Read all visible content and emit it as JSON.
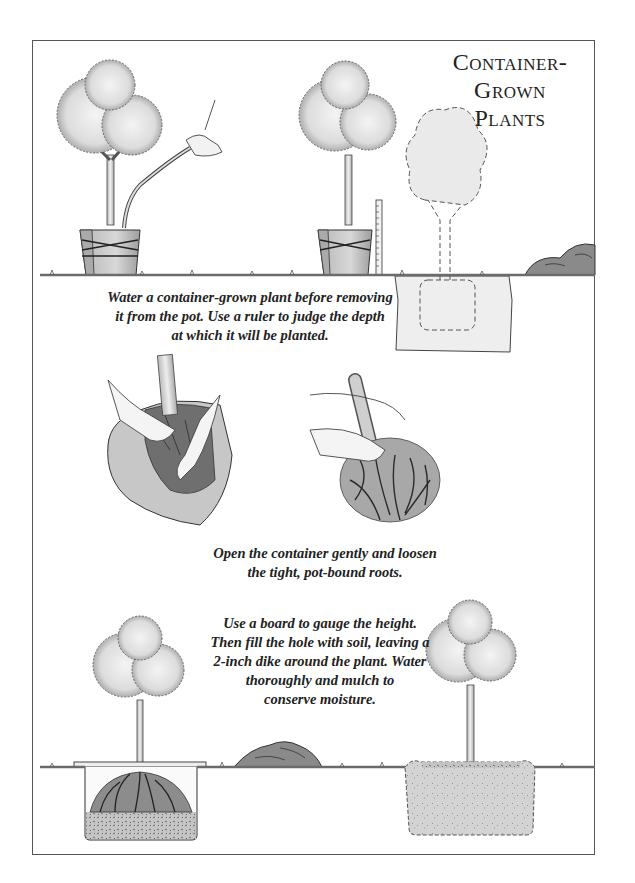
{
  "page": {
    "title_line1": "Container-Grown",
    "title_line2": "Plants"
  },
  "captions": {
    "step1": {
      "lines": [
        "Water a container-grown plant before removing",
        "it from the pot. Use a ruler to judge the depth",
        "at which it will be planted."
      ]
    },
    "step2": {
      "lines": [
        "Open the container gently and loosen",
        "the tight, pot-bound roots."
      ]
    },
    "step3": {
      "lines": [
        "Use a board to gauge the height.",
        "Then fill the hole with soil, leaving a",
        "2-inch dike around the plant. Water",
        "thoroughly and mulch to",
        "conserve moisture."
      ]
    }
  },
  "illustrations": [
    {
      "id": "watering-potted-plant",
      "label": "Tree in tied pot being watered with a hose"
    },
    {
      "id": "ruler-depth-check",
      "label": "Potted tree beside ruler"
    },
    {
      "id": "planting-hole-outline",
      "label": "Dashed outline of tree in planting hole"
    },
    {
      "id": "soil-mound-top",
      "label": "Pile of excavated soil"
    },
    {
      "id": "opening-container",
      "label": "Hands opening the container"
    },
    {
      "id": "loosening-roots",
      "label": "Hands loosening root ball"
    },
    {
      "id": "board-gauge-hole",
      "label": "Tree in hole with board across the top"
    },
    {
      "id": "soil-mound-bottom",
      "label": "Pile of soil"
    },
    {
      "id": "planted-tree-mulched",
      "label": "Planted tree with dike and mulch"
    }
  ],
  "colors": {
    "ink": "#222222",
    "frame": "#555555",
    "foliage": "#d9d9d9",
    "soil": "#bdbdbd",
    "ground": "#6b6b6b"
  }
}
